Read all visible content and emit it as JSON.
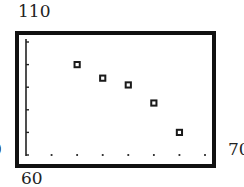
{
  "window": {
    "xmin_label": "0",
    "xmax_label": "70",
    "ymin_label": "60",
    "ymax_label": "110"
  },
  "colors": {
    "frame": "#111111",
    "axis": "#222222",
    "marker": "#1a1a1a",
    "background": "#ffffff"
  },
  "chart_data": {
    "type": "scatter",
    "title": "",
    "xlabel": "",
    "ylabel": "",
    "xlim": [
      0,
      70
    ],
    "ylim": [
      60,
      110
    ],
    "x_tick_spacing": 10,
    "y_tick_spacing": 10,
    "x_ticks": [
      0,
      10,
      20,
      30,
      40,
      50,
      60,
      70
    ],
    "y_ticks": [
      60,
      70,
      80,
      90,
      100,
      110
    ],
    "grid": false,
    "legend": null,
    "marker": "hollow-square",
    "series": [
      {
        "name": "data",
        "x": [
          20,
          30,
          40,
          50,
          60
        ],
        "y": [
          100,
          94,
          91,
          83,
          70
        ]
      }
    ],
    "window_labels": {
      "left": "0",
      "right": "70",
      "bottom": "60",
      "top": "110"
    }
  }
}
